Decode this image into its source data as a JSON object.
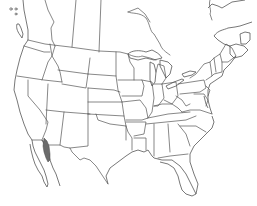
{
  "map": {
    "title": "",
    "region": "North America (USA, southern Canada, northern Mexico)",
    "style": "outline base map with state/province boundaries",
    "colors": {
      "background": "#ffffff",
      "boundary_lines": "#555555",
      "range_fill": "#6b6b6b"
    },
    "highlighted_range": {
      "label": "",
      "location": "Northwestern Mexico (Sonora, east coast of Gulf of California)",
      "fill": "#6b6b6b"
    }
  }
}
